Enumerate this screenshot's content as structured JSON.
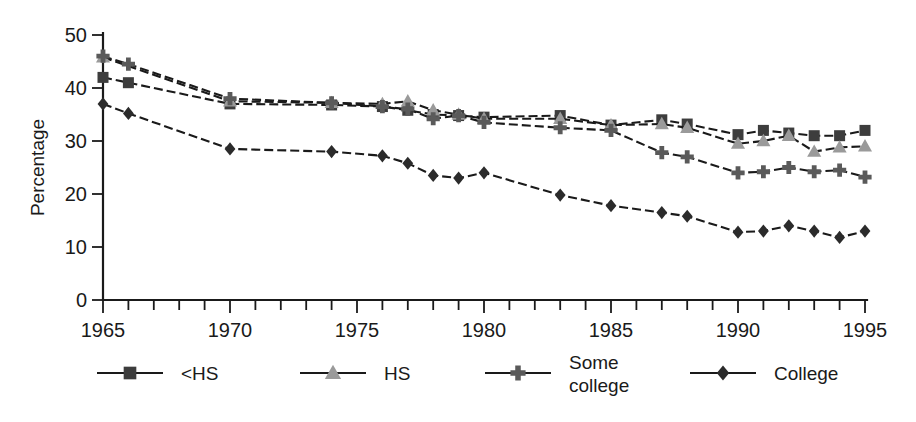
{
  "chart_data": {
    "type": "line",
    "title": "",
    "xlabel": "",
    "ylabel": "Percentage",
    "xlim": [
      1965,
      1995
    ],
    "ylim": [
      0,
      50
    ],
    "grid": false,
    "legend_position": "bottom",
    "y_ticks": [
      "0",
      "10",
      "20",
      "30",
      "40",
      "50"
    ],
    "y_tick_values": [
      0,
      10,
      20,
      30,
      40,
      50
    ],
    "x_ticks": [
      "1965",
      "1970",
      "1975",
      "1980",
      "1985",
      "1990",
      "1995"
    ],
    "x_tick_values": [
      1965,
      1970,
      1975,
      1980,
      1985,
      1990,
      1995
    ],
    "x_minor_tick_values": [
      1965,
      1966,
      1967,
      1968,
      1969,
      1970,
      1971,
      1972,
      1973,
      1974,
      1975,
      1976,
      1977,
      1978,
      1979,
      1980,
      1981,
      1982,
      1983,
      1984,
      1985,
      1986,
      1987,
      1988,
      1989,
      1990,
      1991,
      1992,
      1993,
      1994,
      1995
    ],
    "series": [
      {
        "name": "<HS",
        "marker": "square",
        "color": "#3d3d3d",
        "line_color": "#1a1a1a",
        "dash": "9,4",
        "x": [
          1965,
          1966,
          1970,
          1974,
          1976,
          1977,
          1978,
          1979,
          1980,
          1983,
          1985,
          1987,
          1988,
          1990,
          1991,
          1992,
          1993,
          1994,
          1995
        ],
        "values": [
          42.0,
          41.0,
          37.0,
          36.8,
          36.5,
          35.8,
          35.0,
          34.8,
          34.5,
          34.8,
          33.0,
          34.0,
          33.2,
          31.2,
          32.0,
          31.5,
          31.0,
          31.0,
          32.0
        ]
      },
      {
        "name": "HS",
        "marker": "triangle",
        "color": "#9a9a9a",
        "line_color": "#1a1a1a",
        "dash": "9,4",
        "x": [
          1965,
          1970,
          1974,
          1976,
          1977,
          1978,
          1979,
          1980,
          1983,
          1985,
          1987,
          1988,
          1990,
          1991,
          1992,
          1993,
          1994,
          1995
        ],
        "values": [
          45.8,
          37.5,
          37.2,
          37.0,
          37.5,
          35.8,
          35.0,
          34.2,
          34.2,
          33.0,
          33.2,
          32.5,
          29.5,
          30.0,
          31.0,
          28.0,
          28.8,
          29.0
        ]
      },
      {
        "name": "Some college",
        "marker": "plus",
        "color": "#5a5a5a",
        "line_color": "#1a1a1a",
        "dash": "9,4",
        "x": [
          1965,
          1966,
          1970,
          1974,
          1976,
          1977,
          1978,
          1979,
          1980,
          1983,
          1985,
          1987,
          1988,
          1990,
          1991,
          1992,
          1993,
          1994,
          1995
        ],
        "values": [
          46.0,
          44.5,
          38.0,
          37.2,
          36.5,
          36.0,
          34.2,
          34.8,
          33.5,
          32.5,
          32.0,
          27.8,
          27.0,
          24.0,
          24.2,
          25.0,
          24.2,
          24.5,
          23.2
        ]
      },
      {
        "name": "College",
        "marker": "diamond",
        "color": "#2b2b2b",
        "line_color": "#1a1a1a",
        "dash": "9,4",
        "x": [
          1965,
          1966,
          1970,
          1974,
          1976,
          1977,
          1978,
          1979,
          1980,
          1983,
          1985,
          1987,
          1988,
          1990,
          1991,
          1992,
          1993,
          1994,
          1995
        ],
        "values": [
          37.0,
          35.2,
          28.5,
          28.0,
          27.2,
          25.8,
          23.5,
          23.0,
          24.0,
          19.8,
          17.8,
          16.5,
          15.8,
          12.8,
          13.0,
          14.0,
          13.0,
          11.8,
          13.0
        ]
      }
    ]
  },
  "legend": {
    "items": [
      {
        "label": "<HS",
        "marker": "square",
        "color": "#3d3d3d"
      },
      {
        "label": "HS",
        "marker": "triangle",
        "color": "#9a9a9a"
      },
      {
        "label": "Some",
        "label2": "college",
        "marker": "plus",
        "color": "#5a5a5a"
      },
      {
        "label": "College",
        "marker": "diamond",
        "color": "#2b2b2b"
      }
    ]
  },
  "colors": {
    "axis": "#1a1a1a",
    "background": "#ffffff"
  }
}
